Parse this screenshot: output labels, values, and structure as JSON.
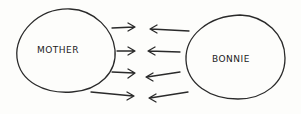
{
  "diagram": {
    "nodes": [
      {
        "id": "mother",
        "label": "MOTHER"
      },
      {
        "id": "bonnie",
        "label": "BONNIE"
      }
    ],
    "edges": [
      {
        "from": "mother",
        "to": "bonnie",
        "count": 4
      },
      {
        "from": "bonnie",
        "to": "mother",
        "count": 4
      }
    ],
    "style": "hand-drawn",
    "stroke_color": "#2a2a2a",
    "background": "#fdfdfb"
  }
}
